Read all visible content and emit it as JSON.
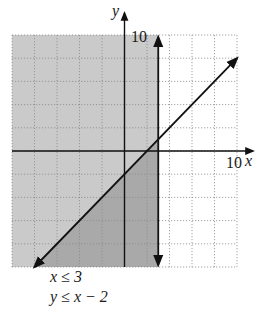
{
  "chart_data": {
    "type": "line",
    "title": "",
    "xlabel": "x",
    "ylabel": "y",
    "xlim": [
      -10,
      10
    ],
    "ylim": [
      -10,
      10
    ],
    "grid": true,
    "grid_step": 2,
    "tick_labels": {
      "x_max": "10",
      "y_max": "10"
    },
    "lines": [
      {
        "name": "x = 3",
        "type": "vertical",
        "x": 3,
        "style": "solid",
        "arrows": "both"
      },
      {
        "name": "y = x - 2",
        "type": "linear",
        "slope": 1,
        "intercept": -2,
        "x_range": [
          -8,
          10
        ],
        "style": "solid",
        "arrows": "both"
      }
    ],
    "shading": [
      {
        "region": "x <= 3",
        "color": "#c8c8c8"
      },
      {
        "region": "y <= x - 2 and x <= 3",
        "color": "#a6a6a6"
      }
    ],
    "annotations": [
      "x ≤ 3",
      "y ≤ x − 2"
    ]
  },
  "labels": {
    "x_axis": "x",
    "y_axis": "y",
    "x_tick": "10",
    "y_tick": "10",
    "inequality_1": "x ≤ 3",
    "inequality_2": "y ≤ x − 2"
  },
  "colors": {
    "light_shade": "#cacaca",
    "dark_shade": "#a9a9a9",
    "grid": "#8a8a8a",
    "ink": "#111111"
  }
}
